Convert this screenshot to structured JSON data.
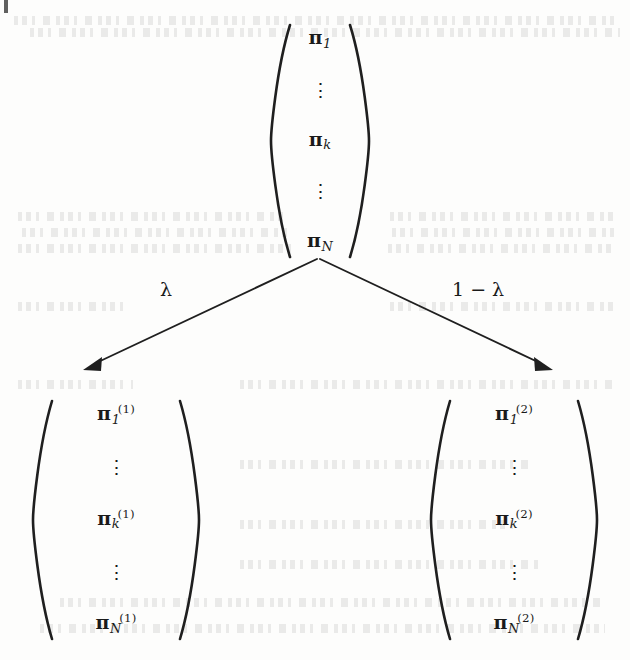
{
  "figure": {
    "type": "probability-vector-split-diagram"
  },
  "top_vector": {
    "name": "pi-vector",
    "entries": [
      {
        "base": "π",
        "sub": "1",
        "sup": ""
      },
      {
        "dots": "⋮"
      },
      {
        "base": "π",
        "sub": "k",
        "sup": ""
      },
      {
        "dots": "⋮"
      },
      {
        "base": "π",
        "sub": "N",
        "sup": ""
      }
    ]
  },
  "left_vector": {
    "name": "pi-superscript-1-vector",
    "entries": [
      {
        "base": "π",
        "sub": "1",
        "sup": "(1)"
      },
      {
        "dots": "⋮"
      },
      {
        "base": "π",
        "sub": "k",
        "sup": "(1)"
      },
      {
        "dots": "⋮"
      },
      {
        "base": "π",
        "sub": "N",
        "sup": "(1)"
      }
    ]
  },
  "right_vector": {
    "name": "pi-superscript-2-vector",
    "entries": [
      {
        "base": "π",
        "sub": "1",
        "sup": "(2)"
      },
      {
        "dots": "⋮"
      },
      {
        "base": "π",
        "sub": "k",
        "sup": "(2)"
      },
      {
        "dots": "⋮"
      },
      {
        "base": "π",
        "sub": "N",
        "sup": "(2)"
      }
    ]
  },
  "branches": {
    "left_label": "λ",
    "right_label": "1 − λ"
  },
  "colors": {
    "ink": "#1a1a1a",
    "paper": "#fdfdfc",
    "rule": "#1f1f1f"
  }
}
